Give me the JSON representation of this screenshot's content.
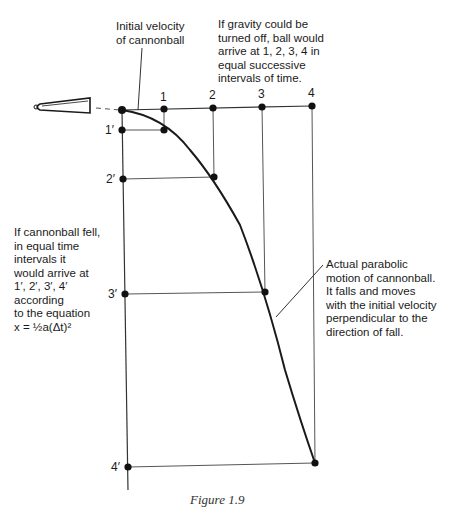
{
  "labels": {
    "initial_velocity": [
      "Initial velocity",
      "of cannonball"
    ],
    "gravity_off": [
      "If gravity could be",
      "turned off, ball would",
      "arrive at 1, 2, 3, 4 in",
      "equal successive",
      "intervals of time."
    ],
    "fall": [
      "If cannonball fell,",
      "in equal time",
      "intervals it",
      "would arrive at",
      "1′, 2′, 3′, 4′",
      "according",
      "to the equation",
      "x = ½a(Δt)²"
    ],
    "parabolic": [
      "Actual parabolic",
      "motion of cannonball.",
      "It falls and moves",
      "with the initial velocity",
      "perpendicular to the",
      "direction of fall."
    ]
  },
  "horizontal_points": [
    "1",
    "2",
    "3",
    "4"
  ],
  "vertical_points": [
    "1′",
    "2′",
    "3′",
    "4′"
  ],
  "caption": "Figure 1.9",
  "colors": {
    "ink": "#1a1a1a",
    "grid": "#555555"
  }
}
